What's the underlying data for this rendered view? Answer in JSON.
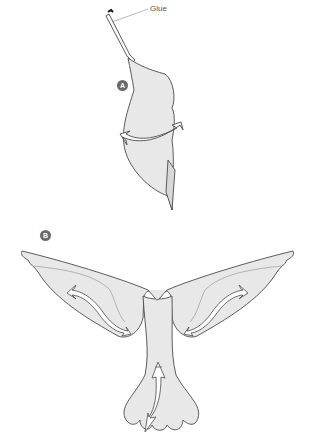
{
  "diagram": {
    "colors": {
      "fill": "#e8e8e8",
      "stroke": "#4a4a4a",
      "badge": "#6a6a6a",
      "inner_line": "#9a9a9a"
    },
    "figures": [
      {
        "id": "A",
        "badge": "A",
        "description": "Side view of bird body, bent with a curved double arrow",
        "callout": "Glue"
      },
      {
        "id": "B",
        "badge": "B",
        "description": "Front view with spread wings and tail; curved double arrows on each wing and tail arrow"
      }
    ]
  }
}
